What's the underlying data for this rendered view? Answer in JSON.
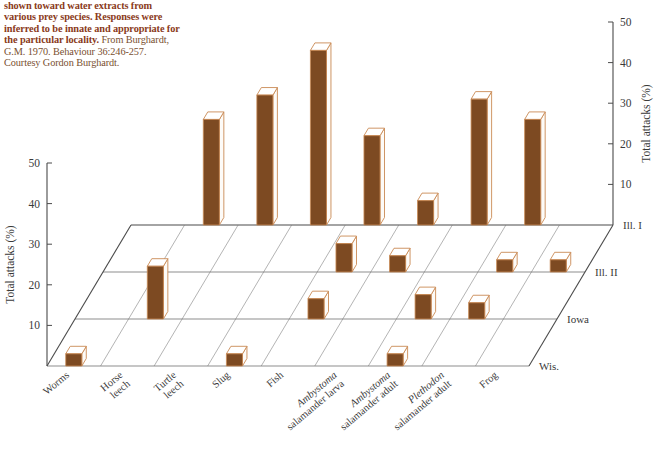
{
  "caption": {
    "bold_part": "shown toward water extracts from various prey species. Responses were inferred to be innate and appropriate for the particular locality.",
    "rest_part": " From Burghardt, G.M. 1970. Behaviour 36:246-257. Courtesy Gordon Burghardt."
  },
  "colors": {
    "bar_front": "#7d4a22",
    "bar_top": "#ffffff",
    "bar_side": "#fdfbf8",
    "bar_outline": "#c98a55",
    "axis": "#4a4a4a",
    "grid": "#7a7a7a",
    "caption_bold": "#8a3a20",
    "caption_rest": "#7a5030",
    "background": "#ffffff"
  },
  "axes": {
    "left": {
      "title": "Total attacks (%)",
      "ticks": [
        "10",
        "20",
        "30",
        "40",
        "50"
      ],
      "tick_values": [
        10,
        20,
        30,
        40,
        50
      ],
      "min": 0,
      "max": 50
    },
    "right": {
      "title": "Total attacks (%)",
      "ticks": [
        "10",
        "20",
        "30",
        "40",
        "50"
      ],
      "tick_values": [
        10,
        20,
        30,
        40,
        50
      ],
      "min": 0,
      "max": 50
    },
    "depth": {
      "labels": [
        "Ill. I",
        "Ill. II",
        "Iowa",
        "Wis."
      ]
    }
  },
  "chart_data": {
    "type": "bar",
    "title": "",
    "xlabel": "",
    "ylabel": "Total attacks (%)",
    "ylim": [
      0,
      50
    ],
    "grid": true,
    "legend_position": "none",
    "categories": [
      "Worms",
      "Horse leech",
      "Turtle leech",
      "Slug",
      "Fish",
      "Ambystoma salamander larva",
      "Ambystoma salamander adult",
      "Plethodon salamander adult",
      "Frog"
    ],
    "categories_rich": [
      [
        {
          "t": "Worms",
          "i": false
        }
      ],
      [
        {
          "t": "Horse",
          "i": false
        },
        {
          "t": "leech",
          "i": false
        }
      ],
      [
        {
          "t": "Turtle",
          "i": false
        },
        {
          "t": "leech",
          "i": false
        }
      ],
      [
        {
          "t": "Slug",
          "i": false
        }
      ],
      [
        {
          "t": "Fish",
          "i": false
        }
      ],
      [
        {
          "t": "Ambystoma",
          "i": true
        },
        {
          "t": "salamander larva",
          "i": false
        }
      ],
      [
        {
          "t": "Ambystoma",
          "i": true
        },
        {
          "t": "salamander adult",
          "i": false
        }
      ],
      [
        {
          "t": "Plethodon",
          "i": true
        },
        {
          "t": "salamander adult",
          "i": false
        }
      ],
      [
        {
          "t": "Frog",
          "i": false
        }
      ]
    ],
    "depth_categories": [
      "Ill. I",
      "Ill. II",
      "Iowa",
      "Wis."
    ],
    "series": [
      {
        "name": "Ill. I",
        "values": [
          0,
          26,
          32,
          43,
          22,
          6,
          31,
          26,
          0
        ]
      },
      {
        "name": "Ill. II",
        "values": [
          0,
          0,
          0,
          0,
          7,
          4,
          0,
          3,
          3
        ]
      },
      {
        "name": "Iowa",
        "values": [
          0,
          13,
          0,
          0,
          5,
          0,
          6,
          4,
          0
        ]
      },
      {
        "name": "Wis.",
        "values": [
          3,
          0,
          0,
          3,
          0,
          0,
          3,
          0,
          0
        ]
      }
    ]
  }
}
